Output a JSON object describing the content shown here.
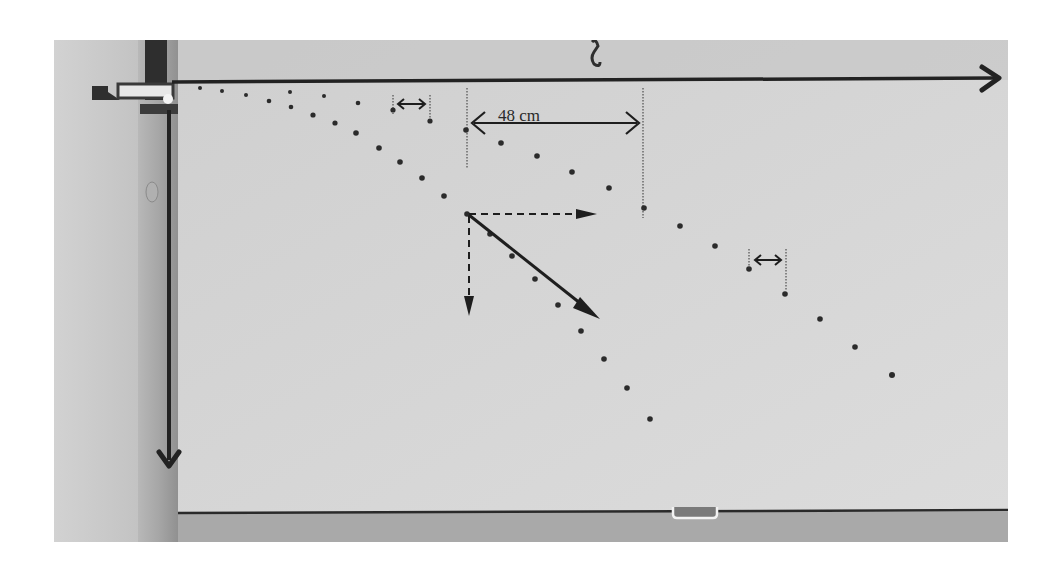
{
  "figure": {
    "annotations": {
      "horizontal_distance_label": "48 cm"
    },
    "colors": {
      "page_background": "#ffffff",
      "board": "#d6d6d6",
      "wall": "#c9c9c9",
      "frame_dark": "#3a3a3a",
      "ink": "#1e1e1e",
      "dot": "#2b2b2b"
    },
    "axes": {
      "x_axis": "horizontal arrow pointing right along top edge",
      "y_axis": "vertical arrow pointing down along left edge"
    },
    "vectors": {
      "velocity": "solid diagonal arrow down-right",
      "horizontal_component": "dashed arrow to the right",
      "vertical_component": "dashed arrow downward"
    },
    "trajectories": [
      {
        "name": "short-range",
        "points": [
          [
            200,
            88
          ],
          [
            222,
            91
          ],
          [
            246,
            95
          ],
          [
            269,
            101
          ],
          [
            291,
            107
          ],
          [
            313,
            115
          ],
          [
            335,
            123
          ],
          [
            356,
            133
          ],
          [
            379,
            148
          ],
          [
            400,
            162
          ],
          [
            422,
            178
          ],
          [
            444,
            196
          ],
          [
            467,
            214
          ],
          [
            490,
            234
          ],
          [
            512,
            256
          ],
          [
            535,
            279
          ],
          [
            558,
            305
          ],
          [
            581,
            331
          ],
          [
            604,
            359
          ],
          [
            627,
            388
          ],
          [
            650,
            419
          ]
        ]
      },
      {
        "name": "long-range",
        "points": [
          [
            290,
            92
          ],
          [
            324,
            96
          ],
          [
            358,
            103
          ],
          [
            392,
            110
          ],
          [
            429,
            121
          ],
          [
            465,
            130
          ],
          [
            501,
            143
          ],
          [
            537,
            156
          ],
          [
            572,
            172
          ],
          [
            608,
            188
          ],
          [
            644,
            208
          ],
          [
            680,
            226
          ],
          [
            715,
            246
          ],
          [
            749,
            269
          ],
          [
            785,
            294
          ],
          [
            820,
            319
          ],
          [
            855,
            347
          ],
          [
            892,
            375
          ]
        ]
      }
    ]
  }
}
